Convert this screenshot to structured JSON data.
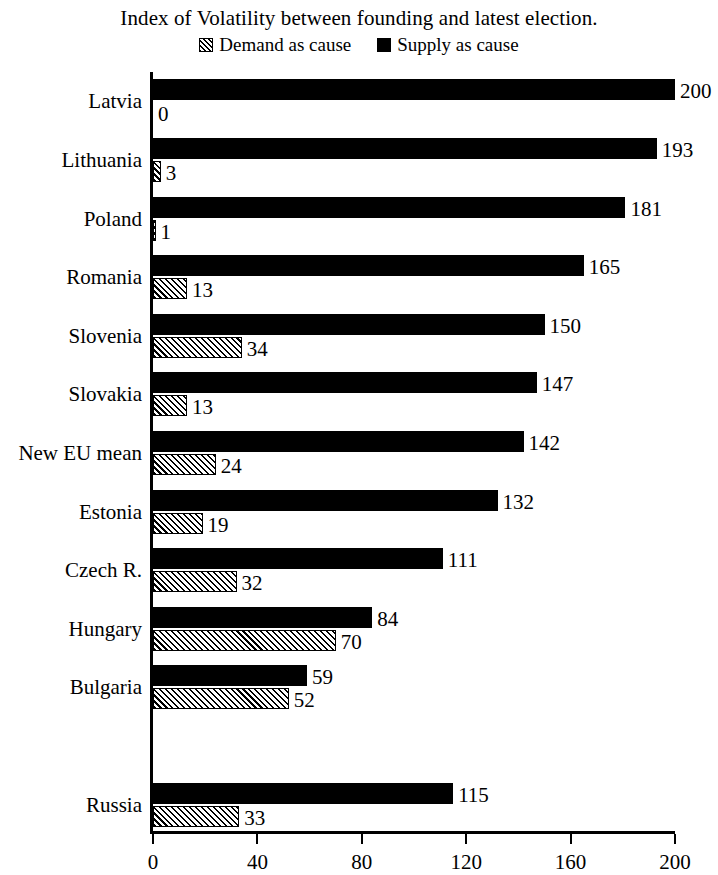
{
  "chart_data": {
    "type": "bar",
    "orientation": "horizontal",
    "title": "Index of Volatility between founding and latest election.",
    "xlabel": "",
    "ylabel": "",
    "xlim": [
      0,
      200
    ],
    "xticks": [
      0,
      40,
      80,
      120,
      160,
      200
    ],
    "grid": false,
    "legend_position": "top-center",
    "categories": [
      "Latvia",
      "Lithuania",
      "Poland",
      "Romania",
      "Slovenia",
      "Slovakia",
      "New EU mean",
      "Estonia",
      "Czech R.",
      "Hungary",
      "Bulgaria",
      "",
      "Russia"
    ],
    "series": [
      {
        "name": "Demand as cause",
        "pattern": "diagonal-hatch",
        "color": "#000000",
        "values": [
          0,
          3,
          1,
          13,
          34,
          13,
          24,
          19,
          32,
          70,
          52,
          null,
          33
        ]
      },
      {
        "name": "Supply as cause",
        "pattern": "solid",
        "color": "#000000",
        "values": [
          200,
          193,
          181,
          165,
          150,
          147,
          142,
          132,
          111,
          84,
          59,
          null,
          115
        ]
      }
    ],
    "value_labels": {
      "Latvia": {
        "supply": "200",
        "demand": "0"
      },
      "Lithuania": {
        "supply": "193",
        "demand": "3"
      },
      "Poland": {
        "supply": "181",
        "demand": "1"
      },
      "Romania": {
        "supply": "165",
        "demand": "13"
      },
      "Slovenia": {
        "supply": "150",
        "demand": "34"
      },
      "Slovakia": {
        "supply": "147",
        "demand": "13"
      },
      "New EU mean": {
        "supply": "142",
        "demand": "24"
      },
      "Estonia": {
        "supply": "132",
        "demand": "19"
      },
      "Czech R.": {
        "supply": "111",
        "demand": "32"
      },
      "Hungary": {
        "supply": "84",
        "demand": "70"
      },
      "Bulgaria": {
        "supply": "59",
        "demand": "52"
      },
      "Russia": {
        "supply": "115",
        "demand": "33"
      }
    }
  },
  "legend": {
    "items": [
      {
        "label": "Demand as cause",
        "swatch": "hatch-square-icon"
      },
      {
        "label": "Supply as cause",
        "swatch": "solid-square-icon"
      }
    ]
  },
  "axis": {
    "tick_labels": [
      "0",
      "40",
      "80",
      "120",
      "160",
      "200"
    ]
  }
}
